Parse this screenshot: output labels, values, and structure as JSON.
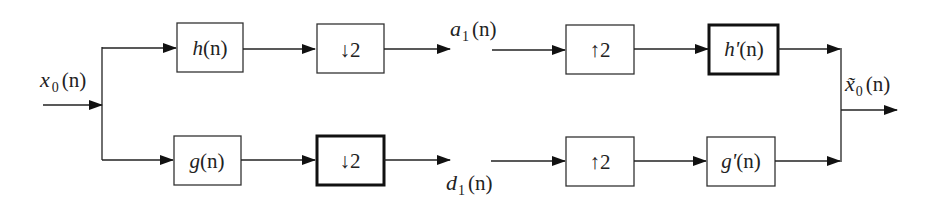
{
  "diagram": {
    "type": "two-channel filter bank (analysis / synthesis)",
    "input_label": {
      "base": "x",
      "sub": "0",
      "arg": "(n)"
    },
    "output_label": {
      "base": "x̃",
      "sub": "0",
      "arg": "(n)"
    },
    "blocks": {
      "h": {
        "name": "h",
        "arg": "(n)"
      },
      "g": {
        "name": "g",
        "arg": "(n)"
      },
      "down_top": {
        "symbol": "↓",
        "factor": "2"
      },
      "down_bottom": {
        "symbol": "↓",
        "factor": "2"
      },
      "up_top": {
        "symbol": "↑",
        "factor": "2"
      },
      "up_bottom": {
        "symbol": "↑",
        "factor": "2"
      },
      "h_prime": {
        "name": "h'",
        "arg": "(n)"
      },
      "g_prime": {
        "name": "g'",
        "arg": "(n)"
      }
    },
    "signals": {
      "a1": {
        "base": "a",
        "sub": "1",
        "arg": "(n)"
      },
      "d1": {
        "base": "d",
        "sub": "1",
        "arg": "(n)"
      }
    }
  }
}
